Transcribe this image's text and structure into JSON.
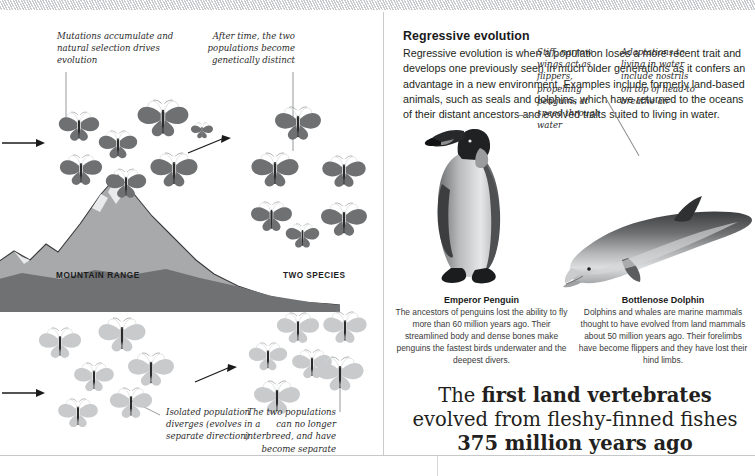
{
  "page": {
    "left_spread": {
      "labels": {
        "mountain_range": "MOUNTAIN RANGE",
        "two_species": "TWO SPECIES"
      },
      "callouts": [
        {
          "name": "mutations",
          "text": "Mutations accumulate and natural selection drives evolution"
        },
        {
          "name": "after-time",
          "text": "After time, the two populations become genetically distinct"
        },
        {
          "name": "isolated-population",
          "text": "Isolated population diverges (evolves in a separate direction)"
        },
        {
          "name": "no-interbreed",
          "text": "The two populations can no longer interbreed, and have become separate species"
        }
      ],
      "icons": {
        "butterfly": "butterfly-icon",
        "arrow": "arrow-right-icon",
        "mountain": "mountain-range-icon"
      }
    },
    "right_spread": {
      "title": "Regressive evolution",
      "body": "Regressive evolution is when a population loses a more recent trait and develops one previously seen in much older generations as it confers an advantage in a new environment. Examples include formerly land-based animals, such as seals and dolphins, which have returned to the oceans of their distant ancestors and evolved traits suited to living in water.",
      "annotations": [
        {
          "name": "penguin-wings",
          "text": "Stiff, narrow wings act as flippers, propelling penguins at speed through water"
        },
        {
          "name": "dolphin-nostrils",
          "text": "Adaptations to living in water include nostrils on top of head to breathe air"
        }
      ],
      "figures": [
        {
          "name": "emperor-penguin",
          "icon": "penguin-icon",
          "caption_title": "Emperor Penguin",
          "caption_body": "The ancestors of penguins lost the ability to fly more than 60 million years ago. Their streamlined body and dense bones make penguins the fastest birds underwater and the deepest divers."
        },
        {
          "name": "bottlenose-dolphin",
          "icon": "dolphin-icon",
          "caption_title": "Bottlenose Dolphin",
          "caption_body": "Dolphins and whales are marine mammals thought to have evolved from land mammals about 50 million years ago. Their forelimbs have become flippers and they have lost their hind limbs."
        }
      ],
      "pullquote": {
        "line1_plain": "The ",
        "line1_bold": "first land vertebrates",
        "line2": "evolved from fleshy-finned fishes",
        "line3": "375 million years ago"
      }
    },
    "colors": {
      "text": "#231f20",
      "rule": "#c6c8c9",
      "butterfly_dark": "#6e7072",
      "butterfly_light": "#c8cacc",
      "mountain_dark": "#6f7173",
      "mountain_mid": "#a7a9ab",
      "mountain_light": "#d6d8d9"
    }
  }
}
